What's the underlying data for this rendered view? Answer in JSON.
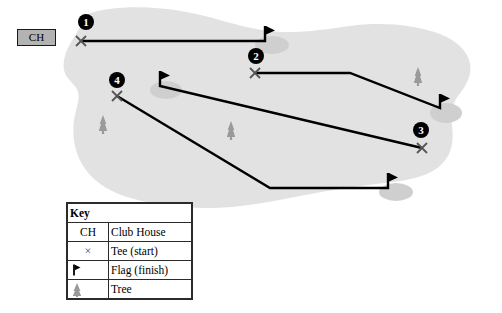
{
  "diagram": {
    "terrain_color": "#e2e2e2",
    "green_color": "#cfcfcf",
    "line_color": "#000000",
    "tree_color": "#9a9a9a"
  },
  "clubhouse": {
    "label": "CH",
    "background": "#b3b3b3",
    "border": "#1a1a1a"
  },
  "holes": [
    {
      "number": "1",
      "marker_x": 86,
      "marker_y": 22,
      "tee_x": 81,
      "tee_y": 41,
      "flag_x": 265,
      "flag_y": 41,
      "path": "81,41 265,41 265,26"
    },
    {
      "number": "2",
      "marker_x": 256,
      "marker_y": 56,
      "tee_x": 255,
      "tee_y": 73,
      "flag_x": 440,
      "flag_y": 108,
      "path": "255,73 350,73 440,108 440,94"
    },
    {
      "number": "3",
      "marker_x": 421,
      "marker_y": 130,
      "tee_x": 422,
      "tee_y": 148,
      "flag_x": 160,
      "flag_y": 86,
      "path": "422,148 160,86 160,71"
    },
    {
      "number": "4",
      "marker_x": 117,
      "marker_y": 80,
      "tee_x": 117,
      "tee_y": 96,
      "flag_x": 388,
      "flag_y": 188,
      "path": "117,96 270,188 388,188 388,173"
    }
  ],
  "greens": [
    {
      "cx": 272,
      "cy": 45,
      "rx": 17,
      "ry": 9
    },
    {
      "cx": 446,
      "cy": 113,
      "rx": 16,
      "ry": 10
    },
    {
      "cx": 166,
      "cy": 90,
      "rx": 16,
      "ry": 9
    },
    {
      "cx": 396,
      "cy": 192,
      "rx": 17,
      "ry": 9
    }
  ],
  "trees": [
    {
      "x": 103,
      "y": 126
    },
    {
      "x": 231,
      "y": 132
    },
    {
      "x": 418,
      "y": 78
    }
  ],
  "key": {
    "title": "Key",
    "rows": [
      {
        "symbol_type": "text",
        "symbol": "CH",
        "label": "Club House"
      },
      {
        "symbol_type": "tee",
        "symbol": "×",
        "label": "Tee (start)"
      },
      {
        "symbol_type": "flag",
        "symbol": "",
        "label": "Flag (finish)"
      },
      {
        "symbol_type": "tree",
        "symbol": "",
        "label": "Tree"
      }
    ]
  }
}
